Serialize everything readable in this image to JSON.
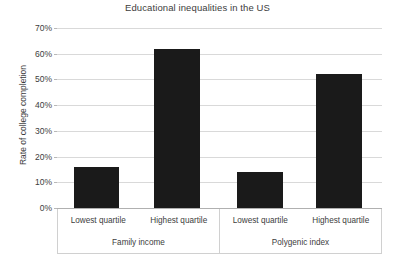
{
  "chart_data": {
    "type": "bar",
    "title": "Educational inequalities in the US",
    "xlabel": "",
    "ylabel": "Rate of college completion",
    "ylim": [
      0,
      70
    ],
    "ytick_labels": [
      "0%",
      "10%",
      "20%",
      "30%",
      "40%",
      "50%",
      "60%",
      "70%"
    ],
    "ytick_values": [
      0,
      10,
      20,
      30,
      40,
      50,
      60,
      70
    ],
    "grid": true,
    "legend": false,
    "groups": [
      {
        "name": "Family income",
        "categories": [
          "Lowest quartile",
          "Highest quartile"
        ],
        "values": [
          16,
          62
        ]
      },
      {
        "name": "Polygenic index",
        "categories": [
          "Lowest quartile",
          "Highest quartile"
        ],
        "values": [
          14,
          52
        ]
      }
    ],
    "categories": [
      "Lowest quartile",
      "Highest quartile",
      "Lowest quartile",
      "Highest quartile"
    ],
    "values": [
      16,
      62,
      14,
      52
    ],
    "bar_color": "#1a1a1a",
    "gridline_color": "#d9d9d9",
    "background_color": "#ffffff"
  },
  "axis": {
    "y_title": "Rate of college completion"
  },
  "labels": {
    "quartile_low_1": "Lowest quartile",
    "quartile_high_1": "Highest quartile",
    "quartile_low_2": "Lowest quartile",
    "quartile_high_2": "Highest quartile",
    "group_1": "Family income",
    "group_2": "Polygenic index"
  },
  "yticks": {
    "t70": "70%",
    "t60": "60%",
    "t50": "50%",
    "t40": "40%",
    "t30": "30%",
    "t20": "20%",
    "t10": "10%",
    "t0": "0%"
  }
}
